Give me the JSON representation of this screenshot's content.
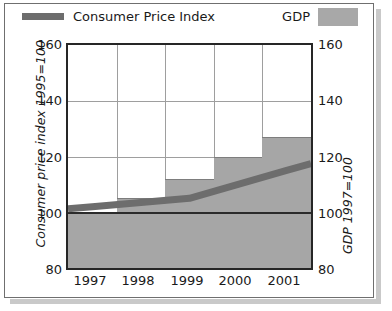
{
  "legend": {
    "series_line_label": "Consumer Price Index",
    "series_bar_label": "GDP",
    "line_color": "#6d6d6d",
    "bar_color": "#a8a8a8"
  },
  "axes": {
    "left_title": "Consumer price index 1995=100",
    "right_title": "GDP 1997=100",
    "y_ticks": [
      "160",
      "140",
      "120",
      "100",
      "80"
    ],
    "x_ticks": [
      "1997",
      "1998",
      "1999",
      "2000",
      "2001"
    ]
  },
  "chart_data": {
    "type": "bar",
    "title": "",
    "subtitle": "",
    "xlabel": "",
    "ylabel": "Consumer price index 1995=100",
    "ylabel_right": "GDP 1997=100",
    "categories": [
      "1997",
      "1998",
      "1999",
      "2000",
      "2001"
    ],
    "ylim": [
      80,
      160
    ],
    "ylim_right": [
      80,
      160
    ],
    "yticks": [
      80,
      100,
      120,
      140,
      160
    ],
    "grid": true,
    "legend_position": "top",
    "series": [
      {
        "name": "GDP",
        "type": "bar",
        "yaxis": "right",
        "color": "#a6a6a6",
        "values": [
          100,
          105,
          112,
          120,
          127
        ]
      },
      {
        "name": "Consumer Price Index",
        "type": "line",
        "yaxis": "left",
        "color": "#6d6d6d",
        "values": [
          102,
          103.5,
          105,
          110,
          115
        ]
      }
    ],
    "annotations": [
      {
        "label": "baseline",
        "value": 100
      }
    ]
  }
}
